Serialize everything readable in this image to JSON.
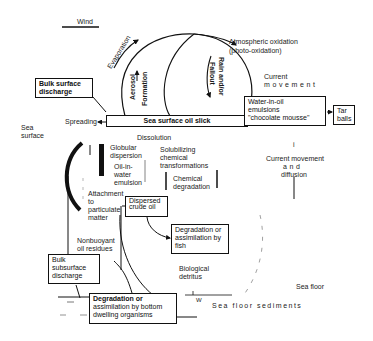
{
  "diagram": {
    "wind": "Wind",
    "evaporation": "Evaporation",
    "aerosol": "Aerosol",
    "formation": "Formation",
    "rain_andor": "Rain and/or",
    "fallout": "Fallout",
    "atmo_line1": "Atmospheric oxidation",
    "atmo_line2": "(photo-oxidation)",
    "current_top_line1": "Current",
    "current_top_line2": "movement",
    "bulk_surface_line1": "Bulk surface",
    "bulk_surface_line2": "discharge",
    "spreading_left": "Spreading",
    "spreading_right": "Spreading",
    "oil_slick": "Sea surface oil slick",
    "emulsion_line1": "Water-in-oil",
    "emulsion_line2": "emulsions",
    "emulsion_line3": "\"chocolate mousse\"",
    "tar_line1": "Tar",
    "tar_line2": "balls",
    "sea_surface_line1": "Sea",
    "sea_surface_line2": "surface",
    "dissolution": "Dissolution",
    "globular_line1": "Globular",
    "globular_line2": "dispersion",
    "oilin_line1": "Oil-in-",
    "oilin_line2": "water",
    "oilin_line3": "emulsion",
    "solub_line1": "Solubilizing",
    "solub_line2": "chemical",
    "solub_line3": "transformations",
    "chem_line1": "Chemical",
    "chem_line2": "degradation",
    "cmd_line1": "Current movement",
    "cmd_line2": "and",
    "cmd_line3": "diffusion",
    "attach_line1": "Attachment",
    "attach_line2": "to",
    "attach_line3": "particulate",
    "attach_line4": "matter",
    "dispersed_line1": "Dispersed",
    "dispersed_line2": "crude oil",
    "fish_line1": "Degradation or",
    "fish_line2": "assimilation by",
    "fish_line3": "fish",
    "nonbuoy_line1": "Nonbuoyant",
    "nonbuoy_line2": "oil residues",
    "bio_line1": "Biological",
    "bio_line2": "detritus",
    "bulk_sub_line1": "Bulk",
    "bulk_sub_line2": "subsurface",
    "bulk_sub_line3": "discharge",
    "bottom_line1": "Degradation or",
    "bottom_line2": "assimilation by bottom",
    "bottom_line3": "dwelling organisms",
    "sea_floor": "Sea floor",
    "sediments": "Sea floor sediments",
    "w_mark": "W"
  }
}
